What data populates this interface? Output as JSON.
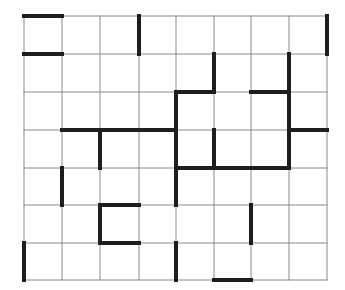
{
  "puzzle": {
    "cols": 8,
    "rows": 7,
    "x_lines": [
      24,
      62,
      100,
      139,
      176,
      214,
      251,
      289,
      327
    ],
    "y_lines": [
      16,
      54,
      92,
      130,
      168,
      205,
      243,
      280
    ],
    "colors": {
      "background": "#ffffff",
      "thin_line": "#8a8a8a",
      "thick_line": "#1e1e1e"
    },
    "thin_width": 1,
    "thick_width": 4,
    "thick_horizontal": [
      {
        "row": 0,
        "from": 0,
        "to": 1
      },
      {
        "row": 1,
        "from": 0,
        "to": 1
      },
      {
        "row": 2,
        "from": 4,
        "to": 5
      },
      {
        "row": 2,
        "from": 6,
        "to": 7
      },
      {
        "row": 3,
        "from": 1,
        "to": 4
      },
      {
        "row": 3,
        "from": 7,
        "to": 8
      },
      {
        "row": 4,
        "from": 4,
        "to": 7
      },
      {
        "row": 5,
        "from": 2,
        "to": 3
      },
      {
        "row": 6,
        "from": 2,
        "to": 3
      },
      {
        "row": 7,
        "from": 5,
        "to": 6
      }
    ],
    "thick_vertical": [
      {
        "col": 3,
        "from": 0,
        "to": 1
      },
      {
        "col": 8,
        "from": 0,
        "to": 1
      },
      {
        "col": 5,
        "from": 1,
        "to": 2
      },
      {
        "col": 7,
        "from": 1,
        "to": 4
      },
      {
        "col": 4,
        "from": 2,
        "to": 5
      },
      {
        "col": 2,
        "from": 3,
        "to": 4
      },
      {
        "col": 5,
        "from": 3,
        "to": 4
      },
      {
        "col": 1,
        "from": 4,
        "to": 5
      },
      {
        "col": 2,
        "from": 5,
        "to": 6
      },
      {
        "col": 6,
        "from": 5,
        "to": 6
      },
      {
        "col": 0,
        "from": 6,
        "to": 7
      },
      {
        "col": 4,
        "from": 6,
        "to": 7
      }
    ]
  }
}
